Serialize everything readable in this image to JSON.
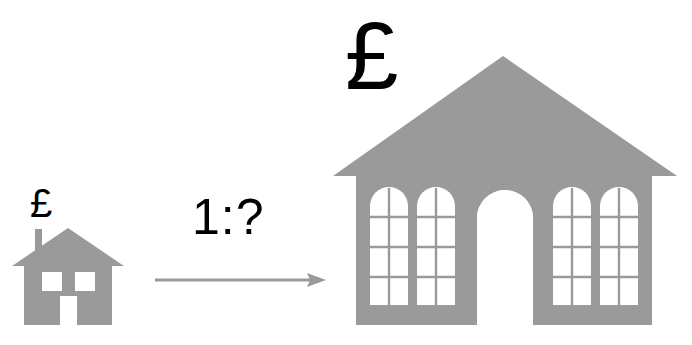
{
  "diagram": {
    "background_color": "#ffffff",
    "shape_fill": "#9a9a9a",
    "ink_color": "#000000"
  },
  "small_house": {
    "name": "small house",
    "currency_symbol": "£",
    "window_count": 2,
    "has_chimney": true,
    "has_door": true
  },
  "ratio": {
    "text": "1:?",
    "left_term": "1",
    "separator": ":",
    "right_term": "?",
    "arrow_direction": "right"
  },
  "large_building": {
    "name": "large building",
    "currency_symbol": "£",
    "window_count": 4,
    "window_panes_columns": 2,
    "window_panes_rows": 4,
    "has_arched_doorway": true,
    "roof_type": "gable"
  }
}
